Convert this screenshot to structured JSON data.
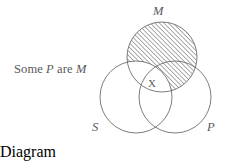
{
  "figure": {
    "type": "venn-diagram",
    "caption_prefix": "Some ",
    "caption_term1": "P",
    "caption_middle": " are ",
    "caption_term2": "M",
    "caption_full": "Some P are M",
    "x_mark": "X",
    "stroke_color": "#6e6e70",
    "text_color": "#58585a",
    "hatch_color": "#5a5a5c",
    "background_color": "#ffffff"
  },
  "circles": [
    {
      "id": "S",
      "label": "S",
      "cx": 136,
      "cy": 97,
      "r": 36,
      "shaded": false
    },
    {
      "id": "P",
      "label": "P",
      "cx": 175,
      "cy": 97,
      "r": 36,
      "shaded": false
    },
    {
      "id": "M",
      "label": "M",
      "cx": 162,
      "cy": 57,
      "r": 35,
      "shaded": true
    }
  ],
  "regions": {
    "hatched_description": "M minus S",
    "x_location": "S and P and M overlap"
  }
}
